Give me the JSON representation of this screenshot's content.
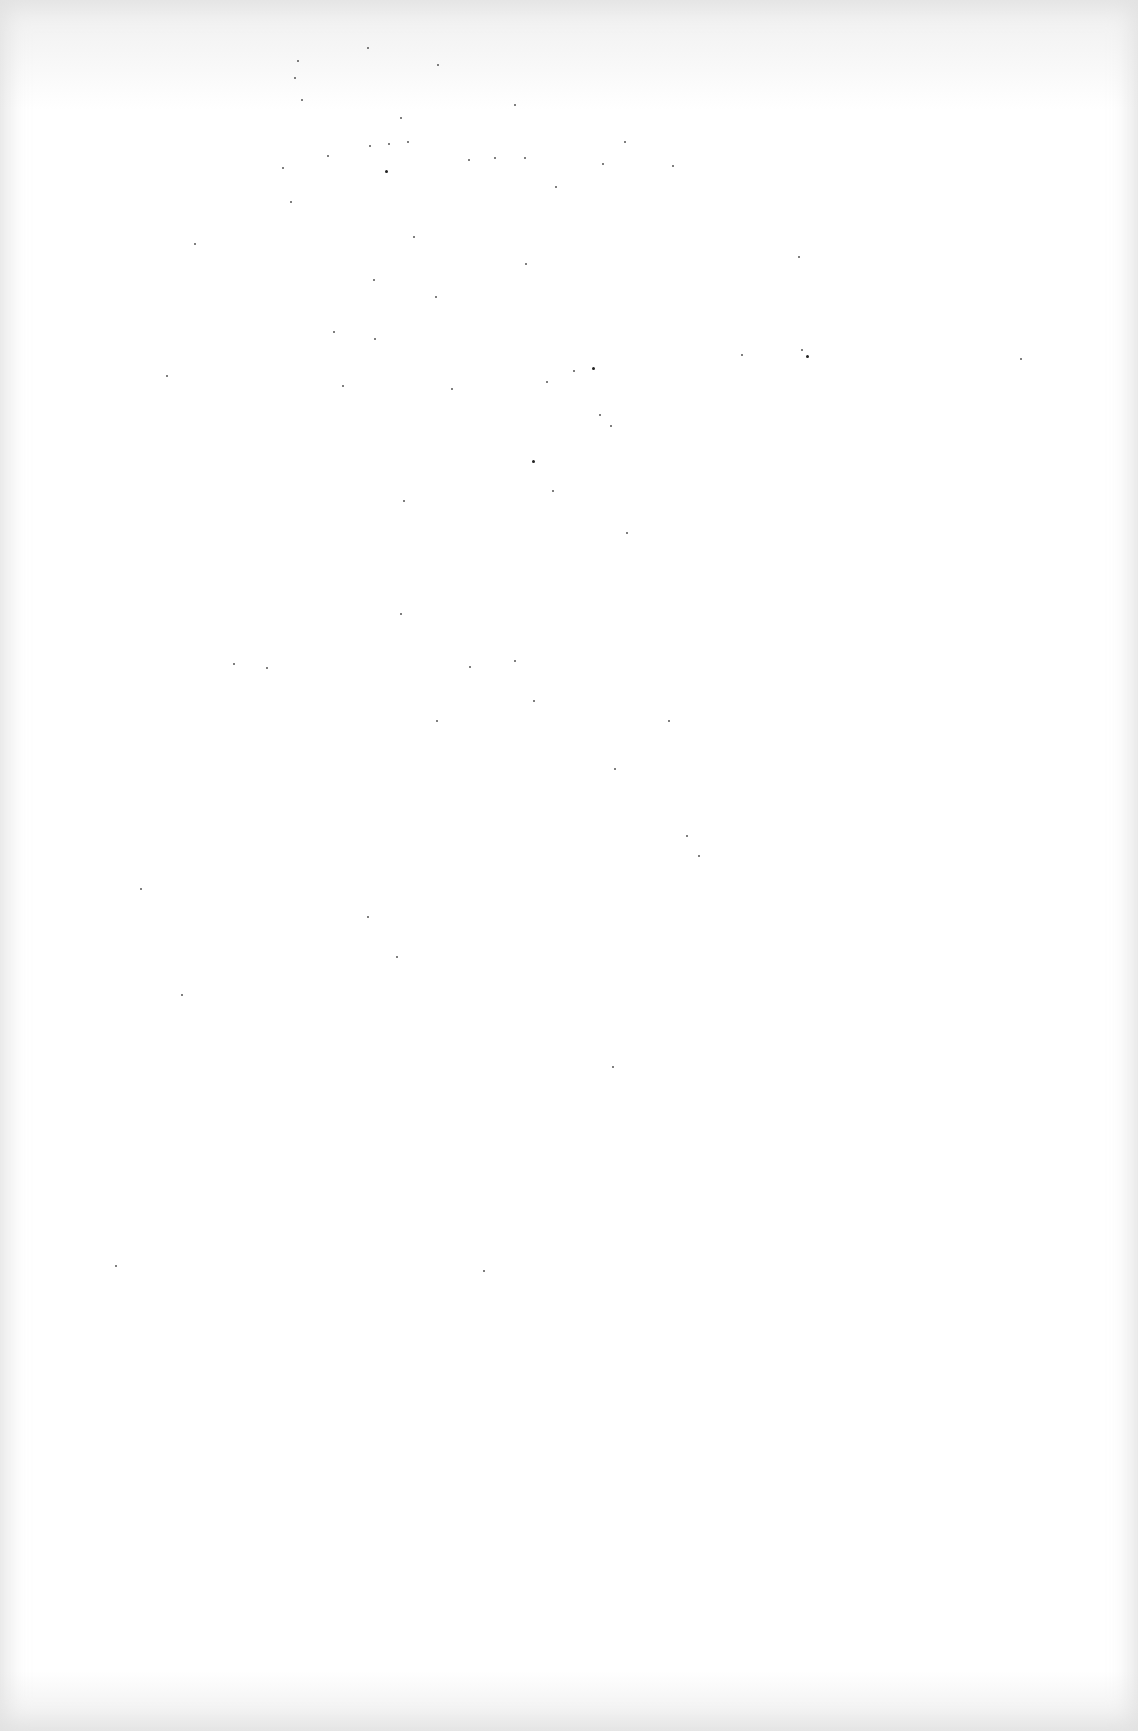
{
  "page": {
    "type": "blank scanned page",
    "background_color": "#ffffff",
    "edge_shade_color": "#e1e1e1",
    "content": "",
    "specks": [
      [
        367,
        47
      ],
      [
        297,
        60
      ],
      [
        294,
        77
      ],
      [
        437,
        64
      ],
      [
        301,
        99
      ],
      [
        400,
        117
      ],
      [
        369,
        145
      ],
      [
        327,
        155
      ],
      [
        282,
        167
      ],
      [
        407,
        141
      ],
      [
        388,
        143
      ],
      [
        514,
        104
      ],
      [
        468,
        159
      ],
      [
        494,
        157
      ],
      [
        524,
        157
      ],
      [
        624,
        141
      ],
      [
        602,
        163
      ],
      [
        672,
        165
      ],
      [
        555,
        186
      ],
      [
        290,
        201
      ],
      [
        413,
        236
      ],
      [
        525,
        263
      ],
      [
        798,
        256
      ],
      [
        194,
        243
      ],
      [
        373,
        279
      ],
      [
        435,
        296
      ],
      [
        333,
        331
      ],
      [
        374,
        338
      ],
      [
        801,
        349
      ],
      [
        741,
        354
      ],
      [
        573,
        370
      ],
      [
        546,
        381
      ],
      [
        166,
        375
      ],
      [
        451,
        388
      ],
      [
        599,
        414
      ],
      [
        610,
        425
      ],
      [
        342,
        385
      ],
      [
        403,
        500
      ],
      [
        552,
        490
      ],
      [
        626,
        532
      ],
      [
        400,
        613
      ],
      [
        233,
        663
      ],
      [
        266,
        667
      ],
      [
        469,
        666
      ],
      [
        533,
        700
      ],
      [
        514,
        660
      ],
      [
        668,
        720
      ],
      [
        436,
        720
      ],
      [
        483,
        1270
      ],
      [
        612,
        1066
      ],
      [
        115,
        1265
      ],
      [
        1020,
        358
      ],
      [
        614,
        768
      ],
      [
        686,
        835
      ],
      [
        698,
        855
      ],
      [
        367,
        916
      ],
      [
        396,
        956
      ],
      [
        181,
        994
      ],
      [
        140,
        888
      ]
    ],
    "dark_specks": [
      [
        385,
        170
      ],
      [
        806,
        355
      ],
      [
        592,
        367
      ],
      [
        532,
        460
      ]
    ]
  }
}
